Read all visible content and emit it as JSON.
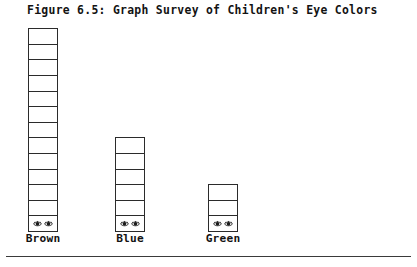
{
  "figure": {
    "title": "Figure 6.5: Graph Survey of Children's Eye Colors",
    "cell_icon": "eye-icon",
    "colors": {
      "ink": "#2b2b2b",
      "paper": "#ffffff",
      "rule": "#3a3a3a"
    }
  },
  "chart_data": {
    "type": "bar",
    "title": "Figure 6.5: Graph Survey of Children's Eye Colors",
    "subtitle": "",
    "xlabel": "",
    "ylabel": "",
    "categories": [
      "Brown",
      "Blue",
      "Green"
    ],
    "values": [
      13,
      6,
      3
    ],
    "unit": "cells",
    "cell_height_px": 15.6,
    "cell_width_px": 28,
    "ylim": [
      0,
      13
    ],
    "grid": false,
    "legend": false,
    "series": [
      {
        "name": "Children",
        "values": [
          13,
          6,
          3
        ]
      }
    ],
    "bars": [
      {
        "category": "Brown",
        "value": 13,
        "label": "Brown",
        "center_x": 43,
        "marked_bottom_cell": true
      },
      {
        "category": "Blue",
        "value": 6,
        "label": "Blue",
        "center_x": 130,
        "marked_bottom_cell": true
      },
      {
        "category": "Green",
        "value": 3,
        "label": "Green",
        "center_x": 223,
        "marked_bottom_cell": true
      }
    ]
  }
}
